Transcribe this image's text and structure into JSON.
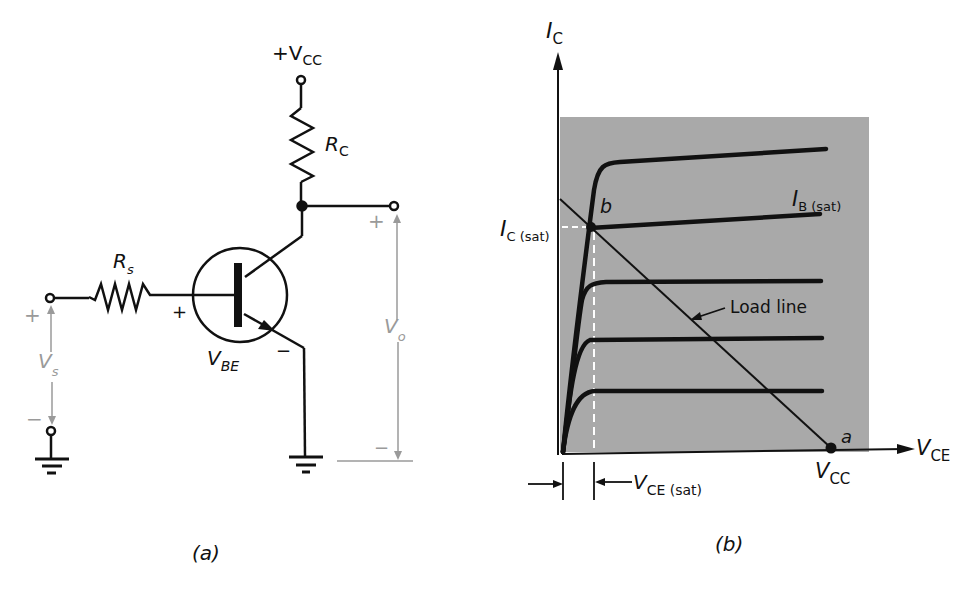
{
  "figure_a": {
    "caption": "(a)",
    "supply_label": "+V",
    "supply_sub": "CC",
    "rc_label": "R",
    "rc_sub": "C",
    "rs_label": "R",
    "rs_sub": "s",
    "vbe_label": "V",
    "vbe_sub": "BE",
    "vbe_plus": "+",
    "vbe_minus": "−",
    "vs_label": "V",
    "vs_sub": "s",
    "vs_plus": "+",
    "vs_minus": "−",
    "vo_label": "V",
    "vo_sub": "o",
    "vo_plus": "+",
    "vo_minus": "−"
  },
  "figure_b": {
    "caption": "(b)",
    "y_axis_label": "I",
    "y_axis_sub": "C",
    "x_axis_label": "V",
    "x_axis_sub": "CE",
    "ic_sat_label": "I",
    "ic_sat_sub": "C (sat)",
    "ib_sat_label": "I",
    "ib_sat_sub": "B (sat)",
    "point_b": "b",
    "point_a": "a",
    "load_line_label": "Load line",
    "vcc_label": "V",
    "vcc_sub": "CC",
    "vce_sat_label": "V",
    "vce_sat_sub": "CE (sat)",
    "shade_color": "#a9a9a9"
  }
}
